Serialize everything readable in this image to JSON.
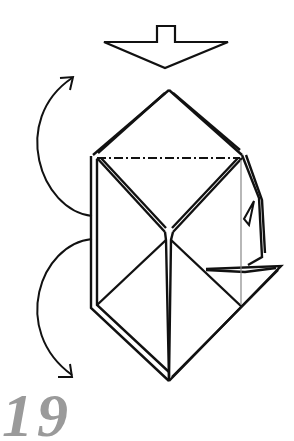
{
  "diagram": {
    "type": "origami-step",
    "step_number": "19",
    "symbols": [
      {
        "name": "push-in-arrow",
        "description": "hollow arrow pointing down"
      },
      {
        "name": "valley-fold-line",
        "style": "dash-dot",
        "description": "horizontal fold line"
      },
      {
        "name": "fold-behind-arrow-top",
        "description": "curved arrow pointing up-right"
      },
      {
        "name": "fold-behind-arrow-bottom",
        "description": "curved arrow pointing down-right"
      }
    ],
    "colors": {
      "line": "#111111",
      "step_number": "#9a9a9a",
      "guide_line": "#888888"
    }
  }
}
